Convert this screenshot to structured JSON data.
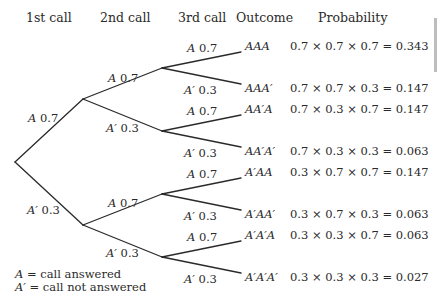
{
  "headers": {
    "first_call": "1st call",
    "second_call": "2nd call",
    "third_call": "3rd call",
    "outcome": "Outcome",
    "probability": "Probability"
  },
  "branches": {
    "first": [
      {
        "event": "A",
        "p": "0.7"
      },
      {
        "event": "A′",
        "p": "0.3"
      }
    ],
    "second": [
      {
        "event": "A",
        "p": "0.7"
      },
      {
        "event": "A′",
        "p": "0.3"
      },
      {
        "event": "A",
        "p": "0.7"
      },
      {
        "event": "A′",
        "p": "0.3"
      }
    ],
    "third": [
      {
        "event": "A",
        "p": "0.7"
      },
      {
        "event": "A′",
        "p": "0.3"
      },
      {
        "event": "A",
        "p": "0.7"
      },
      {
        "event": "A′",
        "p": "0.3"
      },
      {
        "event": "A",
        "p": "0.7"
      },
      {
        "event": "A′",
        "p": "0.3"
      },
      {
        "event": "A",
        "p": "0.7"
      },
      {
        "event": "A′",
        "p": "0.3"
      }
    ]
  },
  "outcomes": [
    {
      "outcome": "AAA",
      "probability": "0.7 × 0.7 × 0.7 = 0.343"
    },
    {
      "outcome": "AAA′",
      "probability": "0.7 × 0.7 × 0.3 = 0.147"
    },
    {
      "outcome": "AA′A",
      "probability": "0.7 × 0.3 × 0.7 = 0.147"
    },
    {
      "outcome": "AA′A′",
      "probability": "0.7 × 0.3 × 0.3 = 0.063"
    },
    {
      "outcome": "A′AA",
      "probability": "0.3 × 0.7 × 0.7 = 0.147"
    },
    {
      "outcome": "A′AA′",
      "probability": "0.3 × 0.7 × 0.3 = 0.063"
    },
    {
      "outcome": "A′A′A",
      "probability": "0.3 × 0.3 × 0.7 = 0.063"
    },
    {
      "outcome": "A′A′A′",
      "probability": "0.3 × 0.3 × 0.3 = 0.027"
    }
  ],
  "legend": [
    {
      "symbol": "A",
      "meaning": "= call answered"
    },
    {
      "symbol": "A′",
      "meaning": "= call not answered"
    }
  ],
  "style": {
    "line_color": "#2a2a2a",
    "text_color": "#2a2a2a",
    "side_bar_color": "#bdbdbd"
  }
}
